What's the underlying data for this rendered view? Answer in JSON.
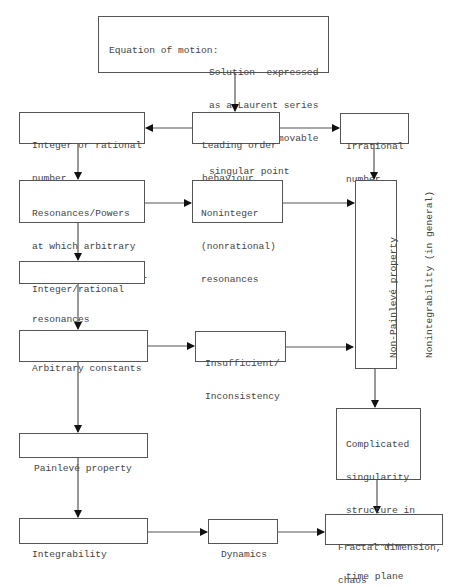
{
  "diagram": {
    "type": "flowchart",
    "nodes": {
      "start": {
        "left": "Equation of motion:",
        "right": [
          "Solution  expressed",
          "as a Laurent series",
          "around  a   movable",
          "singular point"
        ]
      },
      "leading": {
        "lines": [
          "Leading order",
          "behaviour"
        ]
      },
      "integer_rational": {
        "lines": [
          "Integer or rational",
          "number"
        ]
      },
      "irrational": {
        "lines": [
          "Irrational",
          "number"
        ]
      },
      "resonances": {
        "lines": [
          "Resonances/Powers",
          "at which arbitrary",
          "parameters can enter"
        ]
      },
      "noninteger": {
        "lines": [
          "Noninteger",
          "(nonrational)",
          "resonances"
        ]
      },
      "non_painleve": {
        "lines": [
          "Non-Painlevé property",
          "Nonintegrability (in general)"
        ]
      },
      "integer_res": {
        "lines": [
          "Integer/rational",
          "resonances"
        ]
      },
      "arbitrary": {
        "lines": [
          "Arbitrary constants"
        ]
      },
      "insufficient": {
        "lines": [
          "Insufficient/",
          "Inconsistency"
        ]
      },
      "complicated": {
        "lines": [
          "Complicated",
          "singularity",
          "structure in",
          "the complex",
          "time plane"
        ]
      },
      "painleve": {
        "lines": [
          "Painlevé property"
        ]
      },
      "integrability": {
        "lines": [
          "Integrability"
        ]
      },
      "dynamics": {
        "lines": [
          "Dynamics"
        ]
      },
      "fractal": {
        "lines": [
          "Fractal dimension,",
          "chaos"
        ]
      }
    },
    "edges": [
      [
        "start",
        "leading"
      ],
      [
        "leading",
        "integer_rational"
      ],
      [
        "leading",
        "irrational"
      ],
      [
        "integer_rational",
        "resonances"
      ],
      [
        "irrational",
        "non_painleve"
      ],
      [
        "resonances",
        "noninteger"
      ],
      [
        "noninteger",
        "non_painleve"
      ],
      [
        "resonances",
        "integer_res"
      ],
      [
        "integer_res",
        "arbitrary"
      ],
      [
        "arbitrary",
        "insufficient"
      ],
      [
        "insufficient",
        "non_painleve"
      ],
      [
        "non_painleve",
        "complicated"
      ],
      [
        "arbitrary",
        "painleve"
      ],
      [
        "painleve",
        "integrability"
      ],
      [
        "integrability",
        "dynamics"
      ],
      [
        "dynamics",
        "fractal"
      ],
      [
        "complicated",
        "fractal"
      ]
    ]
  }
}
